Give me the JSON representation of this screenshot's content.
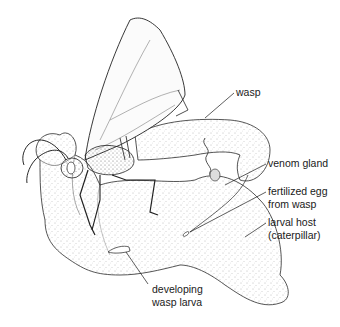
{
  "figure": {
    "labels": {
      "wasp": "wasp",
      "venom_gland": "venom gland",
      "egg_line1": "fertilized egg",
      "egg_line2": "from wasp",
      "host_line1": "larval host",
      "host_line2": "(caterpillar)",
      "larva_line1": "developing",
      "larva_line2": "wasp larva"
    },
    "colors": {
      "ink": "#1a1a1a",
      "stipple": "#8a8a8a",
      "background": "#ffffff"
    }
  }
}
